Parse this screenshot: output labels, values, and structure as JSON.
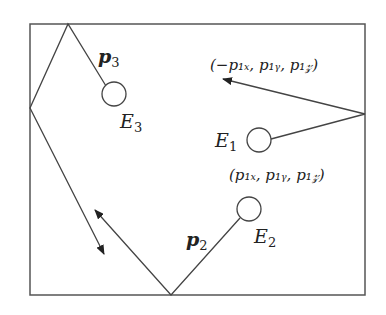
{
  "diagram": {
    "labels": {
      "p3": "p",
      "p3_sub": "3",
      "e3": "E",
      "e3_sub": "3",
      "e1": "E",
      "e1_sub": "1",
      "e2": "E",
      "e2_sub": "2",
      "p2": "p",
      "p2_sub": "2",
      "reflected": "(−p₁ₓ, p₁ᵧ, p₁𝓏)",
      "original": "(p₁ₓ, p₁ᵧ, p₁𝓏)"
    },
    "colors": {
      "stroke": "#444444",
      "text": "#222222"
    }
  }
}
